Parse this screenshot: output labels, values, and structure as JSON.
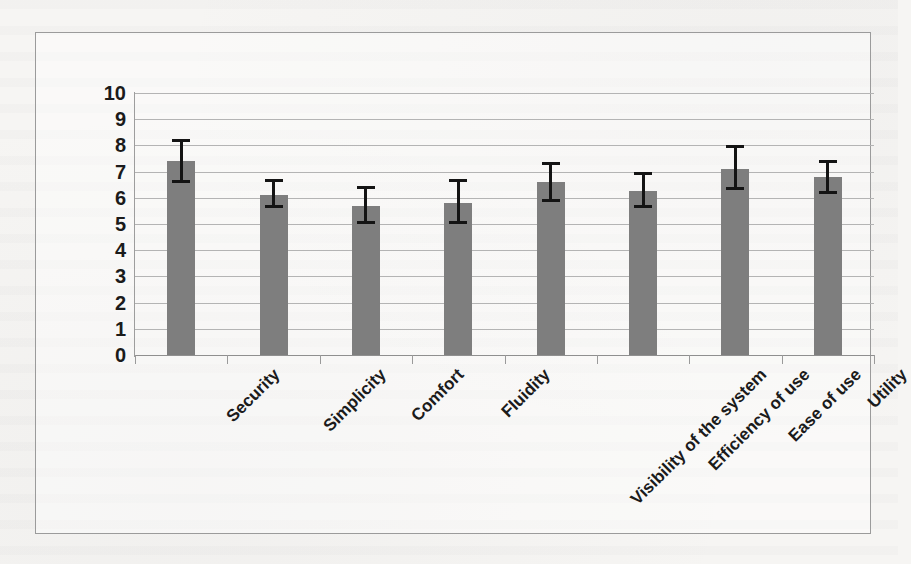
{
  "chart_data": {
    "type": "bar",
    "title": "",
    "subtitle": "",
    "xlabel": "",
    "ylabel": "",
    "categories": [
      "Security",
      "Simplicity",
      "Comfort",
      "Fluidity",
      "Visibility of the system",
      "Efficiency of use",
      "Ease of use",
      "Utility"
    ],
    "values": [
      7.4,
      6.1,
      5.7,
      5.8,
      6.6,
      6.25,
      7.1,
      6.8
    ],
    "error_upper": [
      8.25,
      6.7,
      6.45,
      6.7,
      7.35,
      7.0,
      8.0,
      7.45
    ],
    "error_lower": [
      6.55,
      5.6,
      5.0,
      5.0,
      5.85,
      5.6,
      6.3,
      6.15
    ],
    "ylim": [
      0,
      10
    ],
    "ytick_labels": [
      "10",
      "9",
      "8",
      "7",
      "6",
      "5",
      "4",
      "3",
      "2",
      "1",
      "0"
    ],
    "ytick_values": [
      10,
      9,
      8,
      7,
      6,
      5,
      4,
      3,
      2,
      1,
      0
    ],
    "grid": true,
    "legend": false,
    "legend_position": "none",
    "bar_color": "#7e7e7e",
    "error_color": "#141414",
    "gridline_color": "#b4b4b4",
    "axis_color": "#9a9a9a",
    "plot_background": "#ffffff",
    "page_background": "#f6f5f3",
    "frame_border_color": "#9b9b9b"
  }
}
